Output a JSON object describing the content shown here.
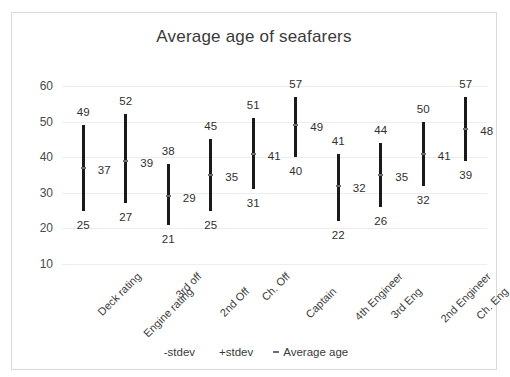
{
  "chart_data": {
    "type": "bar",
    "title": "Average age of seafarers",
    "xlabel": "",
    "ylabel": "",
    "ylim": [
      10,
      60
    ],
    "yticks": [
      10,
      20,
      30,
      40,
      50,
      60
    ],
    "grid": true,
    "legend_position": "bottom",
    "categories": [
      "Deck rating",
      "Engine rating",
      "3rd off",
      "2nd Off",
      "Ch. Off",
      "Captain",
      "4th Engineer",
      "3rd Eng",
      "2nd Engineer",
      "Ch. Eng"
    ],
    "series": [
      {
        "name": "-stdev",
        "values": [
          25,
          27,
          21,
          25,
          31,
          40,
          22,
          26,
          32,
          39
        ]
      },
      {
        "name": "+stdev",
        "values": [
          49,
          52,
          38,
          45,
          51,
          57,
          41,
          44,
          50,
          57
        ]
      },
      {
        "name": "Average age",
        "values": [
          37,
          39,
          29,
          35,
          41,
          49,
          32,
          35,
          41,
          48
        ]
      }
    ],
    "legend": [
      {
        "label": "-stdev",
        "marker": "none"
      },
      {
        "label": "+stdev",
        "marker": "none"
      },
      {
        "label": "Average age",
        "marker": "dash"
      }
    ]
  }
}
